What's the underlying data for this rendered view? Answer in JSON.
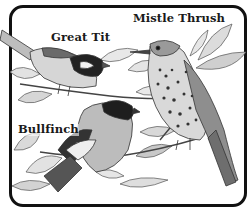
{
  "figure": {
    "labels": {
      "great_tit": "Great Tit",
      "mistle_thrush": "Mistle Thrush",
      "bullfinch": "Bullfinch"
    },
    "colors": {
      "border": "#111111",
      "ink": "#1a1a1a",
      "leaf": "#d8d8d8",
      "leaf_shade": "#a9a9a9",
      "bird_body": "#c9c9c9",
      "bird_dark": "#333333",
      "background": "#ffffff"
    }
  }
}
